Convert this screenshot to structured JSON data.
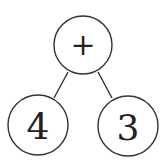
{
  "diagram": {
    "type": "expression-tree",
    "nodes": [
      {
        "id": "root",
        "label": "+",
        "role": "operator"
      },
      {
        "id": "left",
        "label": "4",
        "role": "operand"
      },
      {
        "id": "right",
        "label": "3",
        "role": "operand"
      }
    ],
    "edges": [
      {
        "from": "root",
        "to": "left"
      },
      {
        "from": "root",
        "to": "right"
      }
    ],
    "colors": {
      "stroke": "#333333",
      "text": "#222222",
      "background": "#ffffff"
    }
  }
}
